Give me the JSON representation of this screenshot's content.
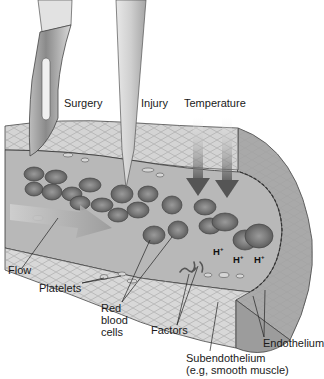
{
  "diagram": {
    "labels": {
      "surgery": "Surgery",
      "injury": "Injury",
      "temperature": "Temperature",
      "flow": "Flow",
      "platelets": "Platelets",
      "red_blood_cells_1": "Red",
      "red_blood_cells_2": "blood",
      "red_blood_cells_3": "cells",
      "factors": "Factors",
      "endothelium": "Endothelium",
      "subendothelium": "Subendothelium",
      "subendothelium_note": "(e.g, smooth muscle)"
    },
    "ions": [
      {
        "symbol": "H",
        "charge": "+"
      },
      {
        "symbol": "H",
        "charge": "+"
      },
      {
        "symbol": "H",
        "charge": "+"
      }
    ],
    "elements": [
      "scalpel",
      "needle",
      "temperature-arrows",
      "flow-arrow",
      "vessel-wall",
      "lumen"
    ],
    "colors": {
      "wall": "#d4d4d4",
      "lumen": "#b8b8b8",
      "rbc": "#8a8a8a",
      "rbc_dark": "#6e6e6e",
      "outer_wall": "#a9a9a9",
      "arrow": "#9a9a9a"
    }
  }
}
